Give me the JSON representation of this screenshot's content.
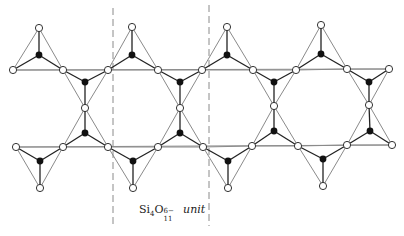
{
  "diagram": {
    "colors": {
      "background": "#ffffff",
      "outline_edge": "#8a8a8a",
      "bond_edge": "#222222",
      "oxygen_fill": "#ffffff",
      "oxygen_stroke": "#333333",
      "silicon_fill": "#111111",
      "divider": "#8a8a8a"
    },
    "unit_label": {
      "formula_base_si": "Si",
      "si_subscript": "4",
      "formula_base_o": "O",
      "o_subscript": "11",
      "charge_superscript": "6−",
      "word": "unit",
      "x": 139,
      "y": 203
    },
    "dividers": [
      {
        "x": 113,
        "y1": 8,
        "y2": 226
      },
      {
        "x": 209,
        "y1": 5,
        "y2": 226
      }
    ],
    "horizontal_lines": [
      {
        "x1": 13,
        "y1": 70,
        "x2": 389,
        "y2": 69
      },
      {
        "x1": 16,
        "y1": 147,
        "x2": 392,
        "y2": 145
      }
    ],
    "legend": {
      "silicon": "filled circle = Si",
      "oxygen": "open circle = O"
    },
    "nodes": {
      "oxygen": [
        [
          39,
          28
        ],
        [
          132,
          27
        ],
        [
          227,
          27
        ],
        [
          321,
          25
        ],
        [
          13,
          70
        ],
        [
          63,
          70
        ],
        [
          108,
          70
        ],
        [
          158,
          70
        ],
        [
          202,
          70
        ],
        [
          253,
          70
        ],
        [
          296,
          70
        ],
        [
          347,
          69
        ],
        [
          389,
          69
        ],
        [
          85,
          108
        ],
        [
          180,
          108
        ],
        [
          274,
          106
        ],
        [
          369,
          105
        ],
        [
          16,
          147
        ],
        [
          63,
          147
        ],
        [
          108,
          147
        ],
        [
          158,
          147
        ],
        [
          203,
          147
        ],
        [
          252,
          146
        ],
        [
          298,
          146
        ],
        [
          347,
          145
        ],
        [
          392,
          145
        ],
        [
          40,
          188
        ],
        [
          133,
          188
        ],
        [
          228,
          188
        ],
        [
          323,
          186
        ]
      ],
      "silicon": [
        [
          39,
          55
        ],
        [
          132,
          55
        ],
        [
          227,
          55
        ],
        [
          321,
          54
        ],
        [
          85,
          82
        ],
        [
          180,
          82
        ],
        [
          274,
          82
        ],
        [
          369,
          82
        ],
        [
          85,
          133
        ],
        [
          180,
          133
        ],
        [
          274,
          131
        ],
        [
          370,
          131
        ],
        [
          40,
          161
        ],
        [
          133,
          161
        ],
        [
          228,
          161
        ],
        [
          323,
          159
        ]
      ]
    },
    "tetrahedra": [
      {
        "si": [
          39,
          55
        ],
        "o": [
          [
            39,
            28
          ],
          [
            13,
            70
          ],
          [
            63,
            70
          ]
        ]
      },
      {
        "si": [
          132,
          55
        ],
        "o": [
          [
            132,
            27
          ],
          [
            108,
            70
          ],
          [
            158,
            70
          ]
        ]
      },
      {
        "si": [
          227,
          55
        ],
        "o": [
          [
            227,
            27
          ],
          [
            202,
            70
          ],
          [
            253,
            70
          ]
        ]
      },
      {
        "si": [
          321,
          54
        ],
        "o": [
          [
            321,
            25
          ],
          [
            296,
            70
          ],
          [
            347,
            69
          ]
        ]
      },
      {
        "si": [
          85,
          82
        ],
        "o": [
          [
            63,
            70
          ],
          [
            108,
            70
          ],
          [
            85,
            108
          ]
        ]
      },
      {
        "si": [
          180,
          82
        ],
        "o": [
          [
            158,
            70
          ],
          [
            202,
            70
          ],
          [
            180,
            108
          ]
        ]
      },
      {
        "si": [
          274,
          82
        ],
        "o": [
          [
            253,
            70
          ],
          [
            296,
            70
          ],
          [
            274,
            106
          ]
        ]
      },
      {
        "si": [
          369,
          82
        ],
        "o": [
          [
            347,
            69
          ],
          [
            389,
            69
          ],
          [
            369,
            105
          ]
        ]
      },
      {
        "si": [
          85,
          133
        ],
        "o": [
          [
            85,
            108
          ],
          [
            63,
            147
          ],
          [
            108,
            147
          ]
        ]
      },
      {
        "si": [
          180,
          133
        ],
        "o": [
          [
            180,
            108
          ],
          [
            158,
            147
          ],
          [
            203,
            147
          ]
        ]
      },
      {
        "si": [
          274,
          131
        ],
        "o": [
          [
            274,
            106
          ],
          [
            252,
            146
          ],
          [
            298,
            146
          ]
        ]
      },
      {
        "si": [
          370,
          131
        ],
        "o": [
          [
            369,
            105
          ],
          [
            347,
            145
          ],
          [
            392,
            145
          ]
        ]
      },
      {
        "si": [
          40,
          161
        ],
        "o": [
          [
            40,
            188
          ],
          [
            16,
            147
          ],
          [
            63,
            147
          ]
        ]
      },
      {
        "si": [
          133,
          161
        ],
        "o": [
          [
            133,
            188
          ],
          [
            108,
            147
          ],
          [
            158,
            147
          ]
        ]
      },
      {
        "si": [
          228,
          161
        ],
        "o": [
          [
            228,
            188
          ],
          [
            203,
            147
          ],
          [
            252,
            146
          ]
        ]
      },
      {
        "si": [
          323,
          159
        ],
        "o": [
          [
            323,
            186
          ],
          [
            298,
            146
          ],
          [
            347,
            145
          ]
        ]
      }
    ]
  }
}
